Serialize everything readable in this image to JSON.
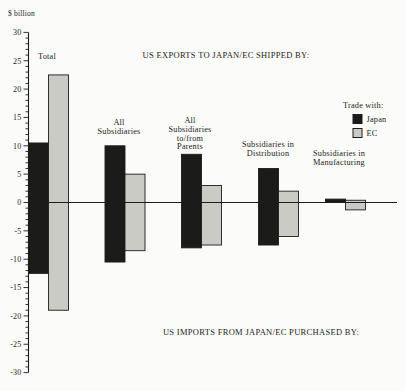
{
  "figure": {
    "background": "#fbfbf9",
    "ink": "#1c1c1a",
    "bar_gray": "#cbcbc5",
    "bar_black": "#1b1b19"
  },
  "chart_data": {
    "type": "bar",
    "title_top": "US EXPORTS TO JAPAN/EC SHIPPED BY:",
    "title_bottom": "US IMPORTS FROM JAPAN/EC PURCHASED BY:",
    "ylabel": "$ billion",
    "ylim": [
      -30,
      30
    ],
    "ytick_step": 5,
    "yminor_step": 1,
    "grid": false,
    "categories": [
      "Total",
      "All Subsidiaries",
      "All Subsidiaries to/from Parents",
      "Subsidiaries in Distribution",
      "Subsidiaries in Manufacturing"
    ],
    "series": [
      {
        "name": "Japan",
        "color": "#1b1b19",
        "exports": [
          10.5,
          10,
          8.5,
          6,
          0.6
        ],
        "imports": [
          -12.5,
          -10.5,
          -8,
          -7.5,
          0
        ]
      },
      {
        "name": "EC",
        "color": "#cbcbc5",
        "exports": [
          22.5,
          5,
          3,
          2,
          0.4
        ],
        "imports": [
          -19,
          -8.5,
          -7.5,
          -6,
          -1.3
        ]
      }
    ],
    "legend": {
      "title": "Trade with:",
      "position": "right",
      "entries": [
        {
          "label": "Japan",
          "color": "#1b1b19"
        },
        {
          "label": "EC",
          "color": "#cbcbc5"
        }
      ]
    },
    "layout": {
      "width": 406,
      "height": 391,
      "zero_y_px": 202.5,
      "px_per_unit": 5.67,
      "axis_x_px": 28.5,
      "zero_line_end_px": 397,
      "bar_width_px": 20,
      "group_left_px": [
        28.5,
        105,
        181.5,
        258.5,
        325.5
      ],
      "tick_major_len": 5,
      "tick_minor_len": 3,
      "category_labels": [
        {
          "lines": [
            "Total"
          ],
          "x": 38,
          "y": 59,
          "align": "start"
        },
        {
          "lines": [
            "All",
            "Subsidiaries"
          ],
          "x": 119,
          "y": 125,
          "align": "middle"
        },
        {
          "lines": [
            "All",
            "Subsidiaries",
            "to/from",
            "Parents"
          ],
          "x": 190,
          "y": 123,
          "align": "middle"
        },
        {
          "lines": [
            "Subsidiaries in",
            "Distribution"
          ],
          "x": 268,
          "y": 147,
          "align": "middle"
        },
        {
          "lines": [
            "Subsidiaries in",
            "Manufacturing"
          ],
          "x": 313,
          "y": 156,
          "align": "start"
        }
      ],
      "line_height": 8.8,
      "title_top_pos": {
        "x": 226,
        "y": 58
      },
      "title_bottom_pos": {
        "x": 261,
        "y": 335
      },
      "ylabel_pos": {
        "x": 8,
        "y": 16
      },
      "legend_pos": {
        "x": 343,
        "y": 108,
        "swatch_x": 353,
        "swatch_size": 9,
        "row1_y": 114.5,
        "row2_y": 128.5,
        "label_x": 366.5
      }
    }
  }
}
